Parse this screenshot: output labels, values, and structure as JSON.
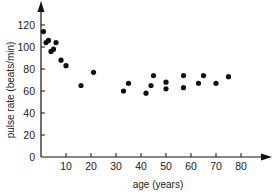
{
  "chart_data": {
    "type": "scatter",
    "title": "",
    "xlabel": "age (years)",
    "ylabel": "pulse rate (beats/min)",
    "xlim": [
      0,
      90
    ],
    "ylim": [
      0,
      140
    ],
    "x_ticks": [
      10,
      20,
      30,
      40,
      50,
      60,
      70,
      80
    ],
    "y_ticks": [
      0,
      20,
      40,
      60,
      80,
      100,
      120
    ],
    "grid": false,
    "legend": null,
    "series": [
      {
        "name": "pulse rate vs age",
        "points": [
          {
            "x": 1,
            "y": 114
          },
          {
            "x": 2,
            "y": 104
          },
          {
            "x": 3,
            "y": 106
          },
          {
            "x": 4,
            "y": 96
          },
          {
            "x": 5,
            "y": 98
          },
          {
            "x": 6,
            "y": 104
          },
          {
            "x": 8,
            "y": 88
          },
          {
            "x": 10,
            "y": 83
          },
          {
            "x": 16,
            "y": 65
          },
          {
            "x": 21,
            "y": 77
          },
          {
            "x": 33,
            "y": 60
          },
          {
            "x": 35,
            "y": 67
          },
          {
            "x": 42,
            "y": 58
          },
          {
            "x": 44,
            "y": 65
          },
          {
            "x": 45,
            "y": 74
          },
          {
            "x": 50,
            "y": 68
          },
          {
            "x": 50,
            "y": 62
          },
          {
            "x": 57,
            "y": 74
          },
          {
            "x": 57,
            "y": 63
          },
          {
            "x": 63,
            "y": 67
          },
          {
            "x": 65,
            "y": 74
          },
          {
            "x": 70,
            "y": 67
          },
          {
            "x": 75,
            "y": 73
          }
        ]
      }
    ]
  },
  "labels": {
    "x_axis": "age (years)",
    "y_axis": "pulse rate (beats/min)"
  },
  "colors": {
    "point": "#111111",
    "axis": "#111111"
  }
}
